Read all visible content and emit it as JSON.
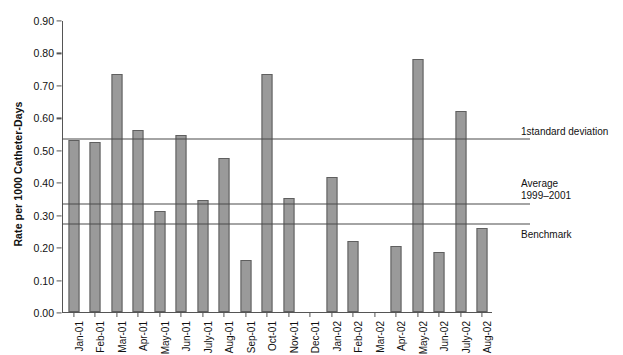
{
  "chart_data": {
    "type": "bar",
    "title": "",
    "xlabel": "",
    "ylabel": "Rate per 1000 Catheter-Days",
    "ylim": [
      0.0,
      0.9
    ],
    "grid": false,
    "legend_position": "right-inline-annotations",
    "ytick_labels": [
      "0.90",
      "0.80",
      "0.70",
      "0.60",
      "0.50",
      "0.40",
      "0.30",
      "0.20",
      "0.10",
      "0.00"
    ],
    "ytick_values": [
      0.9,
      0.8,
      0.7,
      0.6,
      0.5,
      0.4,
      0.3,
      0.2,
      0.1,
      0.0
    ],
    "categories": [
      "Jan-01",
      "Feb-01",
      "Mar-01",
      "Apr-01",
      "May-01",
      "Jun-01",
      "July-01",
      "Aug-01",
      "Sep-01",
      "Oct-01",
      "Nov-01",
      "Dec-01",
      "Jan-02",
      "Feb-02",
      "Mar-02",
      "Apr-02",
      "May-02",
      "Jun-02",
      "July-02",
      "Aug-02"
    ],
    "values": [
      0.53,
      0.525,
      0.735,
      0.56,
      0.31,
      0.545,
      0.345,
      0.475,
      0.16,
      0.735,
      0.35,
      null,
      0.415,
      0.22,
      null,
      0.205,
      0.78,
      0.185,
      0.62,
      0.26
    ],
    "series": [
      {
        "name": "Rate per 1000 Catheter-Days",
        "values": [
          0.53,
          0.525,
          0.735,
          0.56,
          0.31,
          0.545,
          0.345,
          0.475,
          0.16,
          0.735,
          0.35,
          null,
          0.415,
          0.22,
          null,
          0.205,
          0.78,
          0.185,
          0.62,
          0.26
        ]
      }
    ],
    "reference_lines": [
      {
        "label": "1standard deviation",
        "value": 0.535
      },
      {
        "label": "Average\n1999–2001",
        "value": 0.335
      },
      {
        "label": "Benchmark",
        "value": 0.275
      }
    ]
  },
  "annotations": {
    "one_sd": "1standard deviation",
    "average_line1": "Average",
    "average_line2": "1999–2001",
    "benchmark": "Benchmark"
  }
}
